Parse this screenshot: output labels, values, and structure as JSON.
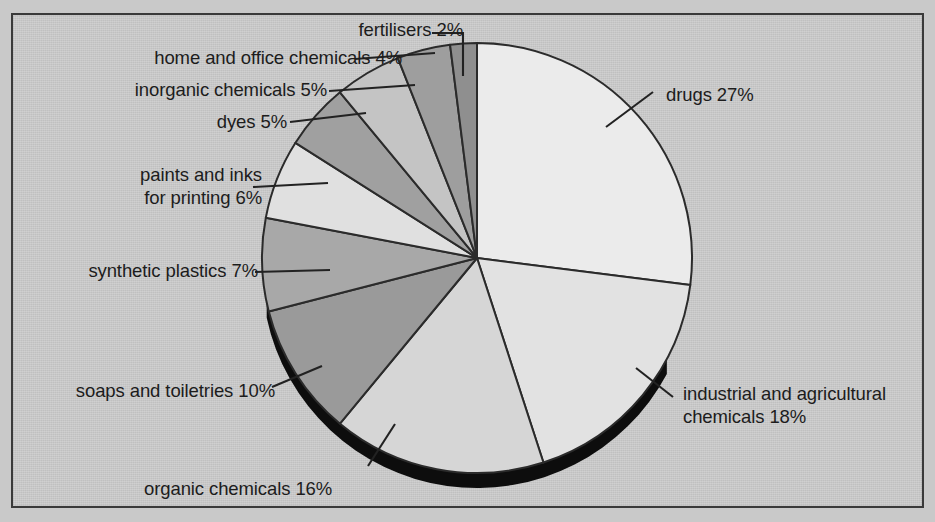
{
  "chart_data": {
    "type": "pie",
    "title": "",
    "subtitle": "",
    "xlabel": "",
    "ylabel": "",
    "legend_position": "callout-labels",
    "grid": false,
    "units": "percent",
    "start_angle_deg": 0,
    "direction": "clockwise",
    "categories": [
      "drugs",
      "industrial and agricultural chemicals",
      "organic chemicals",
      "soaps and toiletries",
      "synthetic plastics",
      "paints and inks for printing",
      "dyes",
      "inorganic chemicals",
      "home and office chemicals",
      "fertilisers"
    ],
    "values": [
      27,
      18,
      16,
      10,
      7,
      6,
      5,
      5,
      4,
      2
    ],
    "labels": [
      "drugs 27%",
      "industrial and agricultural chemicals 18%",
      "organic chemicals 16%",
      "soaps and toiletries 10%",
      "synthetic plastics 7%",
      "paints and inks for printing 6%",
      "dyes 5%",
      "inorganic chemicals 5%",
      "home and office chemicals 4%",
      "fertilisers 2%"
    ],
    "slice_colors": [
      "#ebebeb",
      "#e2e2e2",
      "#d6d6d6",
      "#9a9a9a",
      "#a8a8a8",
      "#e0e0e0",
      "#a0a0a0",
      "#c4c4c4",
      "#9e9e9e",
      "#8f8f8f"
    ]
  },
  "callouts": {
    "fertilisers": {
      "text": "fertilisers 2%"
    },
    "home_office": {
      "text": "home and office chemicals 4%"
    },
    "inorganic": {
      "text": "inorganic chemicals 5%"
    },
    "dyes": {
      "text": "dyes 5%"
    },
    "paints_line1": {
      "text": "paints and inks"
    },
    "paints_line2": {
      "text": "for printing 6%"
    },
    "plastics": {
      "text": "synthetic plastics 7%"
    },
    "soaps": {
      "text": "soaps and toiletries 10%"
    },
    "organic": {
      "text": "organic chemicals 16%"
    },
    "drugs": {
      "text": "drugs 27%"
    },
    "industrial_line1": {
      "text": "industrial and agricultural"
    },
    "industrial_line2": {
      "text": "chemicals 18%"
    }
  },
  "style": {
    "background": "#c7c7c7",
    "outline": "#2b2b2b",
    "shadow": "#0d0d0d"
  }
}
